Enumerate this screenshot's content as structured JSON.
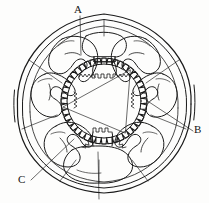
{
  "figure": {
    "kind": "engineering-cross-section-drawing",
    "style": "hand-drawn line art, black ink on white",
    "background_color": "#fdfdfc",
    "ink_color": "#1a1a1a"
  },
  "labels": [
    {
      "id": "A",
      "text": "A",
      "x": 77,
      "y": 7,
      "refers_to": "stator-winding-coil"
    },
    {
      "id": "B",
      "text": "B",
      "x": 196,
      "y": 128,
      "refers_to": "outer-housing-frame"
    },
    {
      "id": "C",
      "text": "C",
      "x": 21,
      "y": 178,
      "refers_to": "stator-pole-body"
    }
  ],
  "leaders": [
    {
      "name": "leader-a",
      "from": [
        80,
        16
      ],
      "to": [
        81,
        55
      ]
    },
    {
      "name": "leader-b",
      "from": [
        193,
        131
      ],
      "to": [
        146,
        100
      ]
    },
    {
      "name": "leader-c",
      "from": [
        31,
        180
      ],
      "to": [
        74,
        139
      ]
    },
    {
      "name": "leader-bottom",
      "from": [
        98,
        152
      ],
      "to": [
        99,
        199
      ]
    }
  ],
  "housing": {
    "name": "outer-housing",
    "center": [
      104,
      101
    ],
    "outer_radius": 89,
    "inner_radius": 84,
    "gap_sides": [
      "left",
      "right"
    ]
  },
  "rotor": {
    "name": "toothed-rotor-gear",
    "center": [
      104,
      101
    ],
    "tip_radius": 43,
    "root_radius": 37,
    "tooth_count": 44,
    "inner_triangle_vertices": [
      [
        130,
        70
      ],
      [
        63,
        107
      ],
      [
        125,
        133
      ]
    ]
  },
  "stator": {
    "pole_count": 6,
    "pole_angles_deg": [
      270,
      330,
      30,
      90,
      150,
      210
    ],
    "pole_shoe_tooth_count": 5,
    "winding_per_pole": true
  },
  "chart_data": {
    "type": "table",
    "columns": [
      "Callout",
      "Component"
    ],
    "rows": [
      [
        "A",
        "Stator winding coil"
      ],
      [
        "B",
        "Outer housing / frame"
      ],
      [
        "C",
        "Stator pole body"
      ]
    ]
  }
}
